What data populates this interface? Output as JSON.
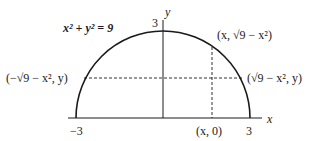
{
  "diagram": {
    "equation": "x² + y² = 9",
    "axis_labels": {
      "x": "x",
      "y": "y"
    },
    "ticks": {
      "top": "3",
      "left": "−3",
      "right": "3"
    },
    "points": {
      "upper_right": "(x, √9 − x²)",
      "left": "(−√9 − x², y)",
      "right": "(√9 − x², y)",
      "bottom": "(x, 0)"
    },
    "colors": {
      "stroke": "#1a1a1a",
      "background": "#ffffff"
    }
  }
}
